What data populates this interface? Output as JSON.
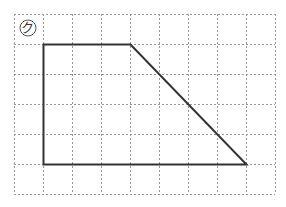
{
  "figure": {
    "label": "ク",
    "label_style": "circled",
    "grid": {
      "cols": 9,
      "rows": 6,
      "origin_x": 14,
      "origin_y": 14,
      "cell_w": 29,
      "cell_h": 30,
      "line_color": "#999999"
    },
    "shape": {
      "type": "trapezoid",
      "stroke": "#333333",
      "vertices_grid": [
        [
          1,
          1
        ],
        [
          4,
          1
        ],
        [
          8,
          5
        ],
        [
          1,
          5
        ]
      ]
    }
  }
}
